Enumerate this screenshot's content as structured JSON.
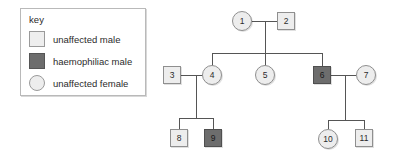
{
  "legend": {
    "title": "key",
    "entries": [
      {
        "symbol": "square-light",
        "label": "unaffected male"
      },
      {
        "symbol": "square-dark",
        "label": "haemophiliac male"
      },
      {
        "symbol": "circle-light",
        "label": "unaffected female"
      }
    ]
  },
  "colors": {
    "unaffected_fill": "#ededed",
    "affected_fill": "#6d6d6d",
    "outline": "#8f8f8f",
    "line": "#555555",
    "background": "#ffffff"
  },
  "pedigree": {
    "individuals": [
      {
        "id": "1",
        "label": "1",
        "sex": "female",
        "shape": "circle",
        "affected": false,
        "generation": 1
      },
      {
        "id": "2",
        "label": "2",
        "sex": "male",
        "shape": "square",
        "affected": false,
        "generation": 1
      },
      {
        "id": "3",
        "label": "3",
        "sex": "male",
        "shape": "square",
        "affected": false,
        "generation": 2
      },
      {
        "id": "4",
        "label": "4",
        "sex": "female",
        "shape": "circle",
        "affected": false,
        "generation": 2
      },
      {
        "id": "5",
        "label": "5",
        "sex": "female",
        "shape": "circle",
        "affected": false,
        "generation": 2
      },
      {
        "id": "6",
        "label": "6",
        "sex": "male",
        "shape": "square",
        "affected": true,
        "generation": 2
      },
      {
        "id": "7",
        "label": "7",
        "sex": "female",
        "shape": "circle",
        "affected": false,
        "generation": 2
      },
      {
        "id": "8",
        "label": "8",
        "sex": "male",
        "shape": "square",
        "affected": false,
        "generation": 3
      },
      {
        "id": "9",
        "label": "9",
        "sex": "male",
        "shape": "square",
        "affected": true,
        "generation": 3
      },
      {
        "id": "10",
        "label": "10",
        "sex": "female",
        "shape": "circle",
        "affected": false,
        "generation": 3
      },
      {
        "id": "11",
        "label": "11",
        "sex": "male",
        "shape": "square",
        "affected": false,
        "generation": 3
      }
    ],
    "matings": [
      {
        "partners": [
          "1",
          "2"
        ],
        "children": [
          "4",
          "5",
          "6"
        ]
      },
      {
        "partners": [
          "3",
          "4"
        ],
        "children": [
          "8",
          "9"
        ]
      },
      {
        "partners": [
          "6",
          "7"
        ],
        "children": [
          "10",
          "11"
        ]
      }
    ]
  }
}
